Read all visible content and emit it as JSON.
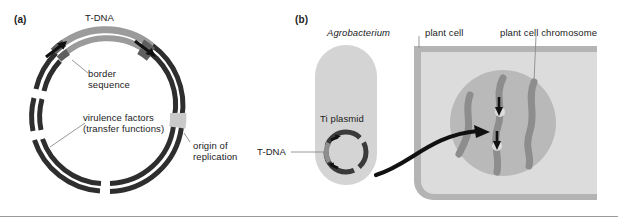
{
  "figure": {
    "panels": [
      {
        "tag": "(a)",
        "name": "ti-plasmid-map",
        "labels": {
          "t_dna": "T-DNA",
          "border_sequence": "border\nsequence",
          "virulence_factors": "virulence factors\n(transfer functions)",
          "origin_of_replication": "origin of\nreplication"
        }
      },
      {
        "tag": "(b)",
        "name": "t-dna-transfer-diagram",
        "labels": {
          "agrobacterium": "Agrobacterium",
          "plant_cell": "plant cell",
          "plant_cell_chromosome": "plant cell chromosome",
          "ti_plasmid": "Ti plasmid",
          "t_dna": "T-DNA"
        }
      }
    ]
  },
  "colors": {
    "dark_ring": "#2e2e2e",
    "t_dna_arc": "#9b9b9b",
    "border_block": "#6d6d6d",
    "origin_block": "#c9c9c9",
    "bacterium_fill": "#d4d4d4",
    "plant_cell_fill": "#dcdcdc",
    "cell_wall": "#b4b4b4",
    "nucleus_fill": "#b9b9b9",
    "chromosome": "#8d8d8d",
    "arrow_black": "#111111",
    "leader_line": "#8c8c8c",
    "text": "#1b1b1b"
  }
}
